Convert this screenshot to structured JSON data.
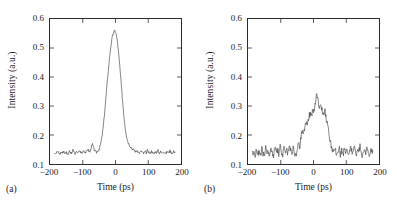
{
  "figure": {
    "background": "#ffffff",
    "line_color": "#4d4d4d",
    "axis_color": "#2b2b2b"
  },
  "panels": [
    {
      "tag": "(a)",
      "xlabel": "Time (ps)",
      "ylabel": "Intensity (a.u.)",
      "xticks": [
        "-200",
        "-100",
        "0",
        "100",
        "200"
      ],
      "yticks": [
        "0.1",
        "0.2",
        "0.3",
        "0.4",
        "0.5",
        "0.6"
      ]
    },
    {
      "tag": "(b)",
      "xlabel": "Time (ps)",
      "ylabel": "Intensity (a.u.)",
      "xticks": [
        "-200",
        "-100",
        "0",
        "100",
        "200"
      ],
      "yticks": [
        "0.1",
        "0.2",
        "0.3",
        "0.4",
        "0.5",
        "0.6"
      ]
    }
  ],
  "chart_data": [
    {
      "type": "line",
      "title": "",
      "panel": "(a)",
      "xlabel": "Time (ps)",
      "ylabel": "Intensity (a.u.)",
      "xlim": [
        -200,
        200
      ],
      "ylim": [
        0.1,
        0.6
      ],
      "xticks": [
        -200,
        -100,
        0,
        100,
        200
      ],
      "yticks": [
        0.1,
        0.2,
        0.3,
        0.4,
        0.5,
        0.6
      ],
      "grid": false,
      "legend": null,
      "baseline": 0.142,
      "peak_value": 0.56,
      "peak_position": -2,
      "x": [
        -186,
        -182,
        -178,
        -174,
        -170,
        -166,
        -162,
        -158,
        -154,
        -150,
        -146,
        -142,
        -138,
        -134,
        -130,
        -126,
        -122,
        -118,
        -114,
        -110,
        -106,
        -102,
        -98,
        -94,
        -90,
        -86,
        -82,
        -78,
        -74,
        -70,
        -66,
        -62,
        -58,
        -54,
        -50,
        -46,
        -42,
        -38,
        -34,
        -30,
        -26,
        -22,
        -18,
        -14,
        -10,
        -6,
        -2,
        2,
        6,
        10,
        14,
        18,
        22,
        26,
        30,
        34,
        38,
        42,
        46,
        50,
        54,
        58,
        62,
        66,
        70,
        74,
        78,
        82,
        86,
        90,
        94,
        98,
        102,
        106,
        110,
        114,
        118,
        122,
        126,
        130,
        134,
        138,
        142,
        146,
        150,
        154,
        158,
        162,
        166,
        170,
        174,
        178,
        182
      ],
      "y": [
        0.141,
        0.137,
        0.143,
        0.139,
        0.134,
        0.142,
        0.138,
        0.145,
        0.136,
        0.141,
        0.133,
        0.144,
        0.139,
        0.136,
        0.147,
        0.14,
        0.135,
        0.143,
        0.138,
        0.146,
        0.141,
        0.136,
        0.149,
        0.143,
        0.139,
        0.151,
        0.146,
        0.142,
        0.158,
        0.168,
        0.152,
        0.144,
        0.14,
        0.146,
        0.152,
        0.166,
        0.188,
        0.222,
        0.268,
        0.318,
        0.372,
        0.422,
        0.468,
        0.508,
        0.536,
        0.552,
        0.56,
        0.548,
        0.52,
        0.478,
        0.424,
        0.368,
        0.312,
        0.262,
        0.222,
        0.194,
        0.176,
        0.166,
        0.16,
        0.154,
        0.15,
        0.146,
        0.143,
        0.147,
        0.141,
        0.138,
        0.145,
        0.14,
        0.136,
        0.143,
        0.139,
        0.147,
        0.141,
        0.137,
        0.144,
        0.139,
        0.135,
        0.143,
        0.14,
        0.146,
        0.138,
        0.142,
        0.137,
        0.144,
        0.14,
        0.136,
        0.143,
        0.139,
        0.145,
        0.141,
        0.137,
        0.143,
        0.14,
        0.142
      ]
    },
    {
      "type": "line",
      "title": "",
      "panel": "(b)",
      "xlabel": "Time (ps)",
      "ylabel": "Intensity (a.u.)",
      "xlim": [
        -200,
        200
      ],
      "ylim": [
        0.1,
        0.6
      ],
      "xticks": [
        -200,
        -100,
        0,
        100,
        200
      ],
      "yticks": [
        0.1,
        0.2,
        0.3,
        0.4,
        0.5,
        0.6
      ],
      "grid": false,
      "legend": null,
      "baseline": 0.142,
      "peak_value": 0.348,
      "peak_position": 10,
      "x": [
        -186,
        -182,
        -178,
        -174,
        -170,
        -166,
        -162,
        -158,
        -154,
        -150,
        -146,
        -142,
        -138,
        -134,
        -130,
        -126,
        -122,
        -118,
        -114,
        -110,
        -106,
        -102,
        -98,
        -94,
        -90,
        -86,
        -82,
        -78,
        -74,
        -70,
        -66,
        -62,
        -58,
        -54,
        -50,
        -46,
        -42,
        -38,
        -34,
        -30,
        -26,
        -22,
        -18,
        -14,
        -10,
        -6,
        -2,
        2,
        6,
        10,
        14,
        18,
        22,
        26,
        30,
        34,
        38,
        42,
        46,
        50,
        54,
        58,
        62,
        66,
        70,
        74,
        78,
        82,
        86,
        90,
        94,
        98,
        102,
        106,
        110,
        114,
        118,
        122,
        126,
        130,
        134,
        138,
        142,
        146,
        150,
        154,
        158,
        162,
        166,
        170,
        174,
        178,
        182
      ],
      "y": [
        0.136,
        0.148,
        0.128,
        0.152,
        0.132,
        0.144,
        0.126,
        0.15,
        0.138,
        0.128,
        0.155,
        0.134,
        0.146,
        0.13,
        0.152,
        0.14,
        0.128,
        0.158,
        0.136,
        0.148,
        0.132,
        0.16,
        0.142,
        0.13,
        0.155,
        0.138,
        0.15,
        0.134,
        0.162,
        0.146,
        0.132,
        0.156,
        0.14,
        0.128,
        0.148,
        0.172,
        0.158,
        0.196,
        0.218,
        0.206,
        0.232,
        0.248,
        0.236,
        0.262,
        0.276,
        0.268,
        0.29,
        0.282,
        0.31,
        0.348,
        0.318,
        0.296,
        0.312,
        0.288,
        0.272,
        0.288,
        0.262,
        0.238,
        0.212,
        0.186,
        0.164,
        0.148,
        0.136,
        0.152,
        0.13,
        0.144,
        0.158,
        0.134,
        0.15,
        0.128,
        0.16,
        0.138,
        0.152,
        0.13,
        0.146,
        0.164,
        0.134,
        0.148,
        0.156,
        0.132,
        0.15,
        0.138,
        0.162,
        0.14,
        0.128,
        0.154,
        0.136,
        0.148,
        0.158,
        0.132,
        0.146,
        0.152,
        0.138,
        0.144
      ]
    }
  ]
}
